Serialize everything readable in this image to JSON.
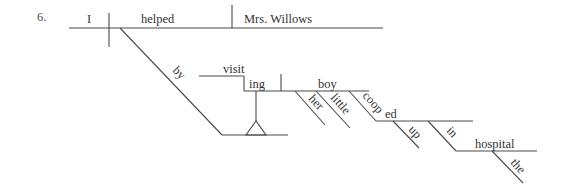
{
  "item_number": "6.",
  "diagram": {
    "type": "Reed-Kellogg sentence diagram",
    "main_line": {
      "subject": "I",
      "verb": "helped",
      "direct_object": "Mrs. Willows"
    },
    "prepositional_phrase": {
      "preposition": "by",
      "gerund_stem": "visit",
      "gerund_suffix": "ing",
      "gerund_object": "boy",
      "object_modifiers": [
        "her",
        "little"
      ],
      "participle_stem": "coop",
      "participle_suffix": "ed",
      "participle_modifier": "up",
      "inner_preposition": "in",
      "inner_object": "hospital",
      "inner_object_modifier": "the"
    }
  },
  "colors": {
    "line": "#4a4a4a",
    "text": "#333333",
    "background": "#ffffff"
  }
}
